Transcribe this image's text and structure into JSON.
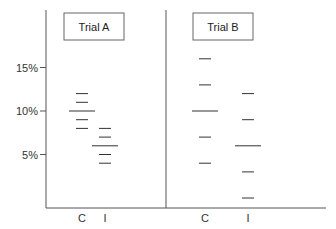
{
  "chart_data": {
    "type": "scatter",
    "subtype": "dot-dash plot (individual values with mean line)",
    "title": "",
    "ylabel": "",
    "xlabel": "",
    "y_ticks": [
      "5%",
      "10%",
      "15%"
    ],
    "y_tick_values": [
      5,
      10,
      15
    ],
    "ylim": [
      0,
      18
    ],
    "grid": false,
    "legend": null,
    "panels": [
      {
        "title": "Trial A",
        "categories": [
          "C",
          "I"
        ],
        "series": [
          {
            "name": "C",
            "values": [
              12,
              11,
              9,
              8
            ],
            "mean": 10
          },
          {
            "name": "I",
            "values": [
              8,
              7,
              5,
              4
            ],
            "mean": 6
          }
        ]
      },
      {
        "title": "Trial B",
        "categories": [
          "C",
          "I"
        ],
        "series": [
          {
            "name": "C",
            "values": [
              16,
              13,
              7,
              4
            ],
            "mean": 10
          },
          {
            "name": "I",
            "values": [
              12,
              9,
              3,
              0
            ],
            "mean": 6
          }
        ]
      }
    ]
  },
  "colors": {
    "axis": "#555555",
    "marks": "#333333",
    "box_border": "#666666"
  }
}
